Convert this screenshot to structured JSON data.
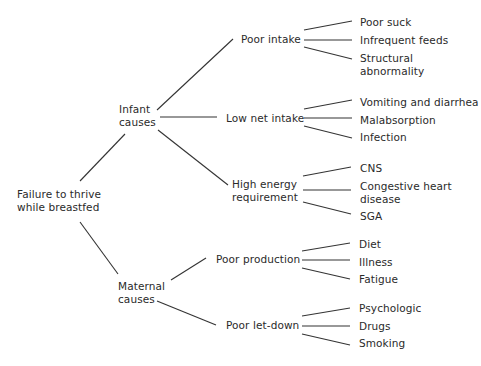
{
  "diagram": {
    "root": {
      "line1": "Failure to thrive",
      "line2": "while breastfed"
    },
    "infant": {
      "line1": "Infant",
      "line2": "causes",
      "poor_intake": {
        "label": "Poor intake",
        "children": [
          "Poor suck",
          "Infrequent feeds",
          "Structural",
          "abnormality"
        ]
      },
      "low_net_intake": {
        "label": "Low net intake",
        "children": [
          "Vomiting and diarrhea",
          "Malabsorption",
          "Infection"
        ]
      },
      "high_energy": {
        "line1": "High energy",
        "line2": "requirement",
        "children": [
          "CNS",
          "Congestive heart",
          "disease",
          "SGA"
        ]
      }
    },
    "maternal": {
      "line1": "Maternal",
      "line2": "causes",
      "poor_production": {
        "label": "Poor production",
        "children": [
          "Diet",
          "Illness",
          "Fatigue"
        ]
      },
      "poor_letdown": {
        "label": "Poor let-down",
        "children": [
          "Psychologic",
          "Drugs",
          "Smoking"
        ]
      }
    }
  },
  "colors": {
    "line": "#333333",
    "text": "#2a2a2a",
    "background": "#ffffff"
  }
}
